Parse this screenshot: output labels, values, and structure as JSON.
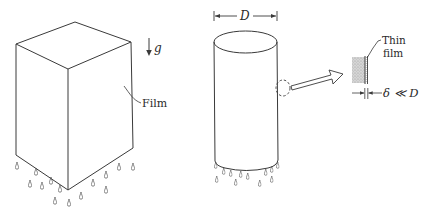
{
  "figure": {
    "left_panel": {
      "gravity_label": "g",
      "film_label": "Film"
    },
    "right_panel": {
      "diameter_label": "D",
      "detail_label_line1": "Thin",
      "detail_label_line2": "film",
      "thickness_label": "δ ≪ D"
    },
    "colors": {
      "line": "#3a3a3a",
      "film_fill": "#c8c8c8",
      "background": "#ffffff"
    }
  }
}
